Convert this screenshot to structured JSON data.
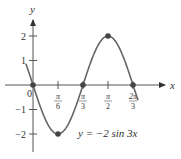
{
  "chart_data": {
    "type": "line",
    "title": "",
    "equation_label": "y = −2 sin 3x",
    "xlabel": "x",
    "ylabel": "y",
    "x_ticks": [
      "π/6",
      "π/3",
      "π/2",
      "2π/3"
    ],
    "x_tick_values": [
      0.5236,
      1.0472,
      1.5708,
      2.0944
    ],
    "y_ticks": [
      "2",
      "1",
      "−1",
      "−2"
    ],
    "y_tick_values": [
      2,
      1,
      -1,
      -2
    ],
    "origin_label": "0",
    "xlim": [
      -0.95,
      3.4
    ],
    "ylim": [
      -2.6,
      2.8
    ],
    "grid": false,
    "series": [
      {
        "name": "y = −2 sin 3x",
        "function": "-2*sin(3x)",
        "x_range": [
          -0.15,
          2.2
        ],
        "highlight_points": [
          {
            "x": 0,
            "y": 0
          },
          {
            "x": 0.5236,
            "y": -2
          },
          {
            "x": 1.0472,
            "y": 0
          },
          {
            "x": 1.5708,
            "y": 2
          },
          {
            "x": 2.0944,
            "y": 0
          }
        ]
      }
    ]
  }
}
